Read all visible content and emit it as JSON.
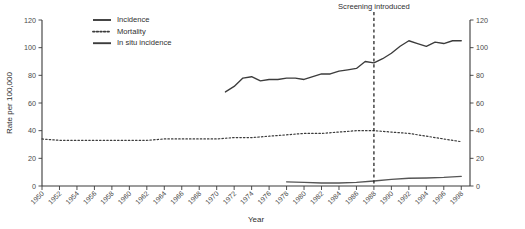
{
  "chart_data": {
    "type": "line",
    "title": "",
    "xlabel": "Year",
    "ylabel": "Rate per 100,000",
    "ylabel_right": "",
    "xlim": [
      1950,
      1999
    ],
    "ylim": [
      0,
      120
    ],
    "grid": false,
    "legend_position": "top-left",
    "y_ticks": [
      0,
      20,
      40,
      60,
      80,
      100,
      120
    ],
    "y_ticks_right": [
      0,
      20,
      40,
      60,
      80,
      100,
      120
    ],
    "x_ticks": [
      1950,
      1952,
      1954,
      1956,
      1958,
      1960,
      1962,
      1964,
      1966,
      1968,
      1970,
      1972,
      1974,
      1976,
      1978,
      1980,
      1982,
      1984,
      1986,
      1988,
      1990,
      1992,
      1994,
      1996,
      1998
    ],
    "annotations": [
      {
        "name": "screening-introduced",
        "label": "Screening introduced",
        "x": 1988,
        "style": "dashed-vertical-line"
      }
    ],
    "series": [
      {
        "name": "Incidence",
        "style": "solid",
        "x": [
          1971,
          1972,
          1973,
          1974,
          1975,
          1976,
          1977,
          1978,
          1979,
          1980,
          1981,
          1982,
          1983,
          1984,
          1985,
          1986,
          1987,
          1988,
          1989,
          1990,
          1991,
          1992,
          1993,
          1994,
          1995,
          1996,
          1997,
          1998
        ],
        "values": [
          68,
          72,
          78,
          79,
          76,
          77,
          77,
          78,
          78,
          77,
          79,
          81,
          81,
          83,
          84,
          85,
          90,
          89,
          92,
          96,
          101,
          105,
          103,
          101,
          104,
          103,
          105,
          105
        ]
      },
      {
        "name": "Mortality",
        "style": "dotted",
        "x": [
          1950,
          1952,
          1954,
          1956,
          1958,
          1960,
          1962,
          1964,
          1966,
          1968,
          1970,
          1972,
          1974,
          1976,
          1978,
          1980,
          1982,
          1984,
          1986,
          1988,
          1990,
          1992,
          1994,
          1996,
          1998
        ],
        "values": [
          34,
          33,
          33,
          33,
          33,
          33,
          33,
          34,
          34,
          34,
          34,
          35,
          35,
          36,
          37,
          38,
          38,
          39,
          40,
          40,
          39,
          38,
          36,
          34,
          32
        ]
      },
      {
        "name": "In situ incidence",
        "style": "solid",
        "x": [
          1978,
          1980,
          1982,
          1984,
          1986,
          1988,
          1990,
          1992,
          1994,
          1996,
          1998
        ],
        "values": [
          3.0,
          2.6,
          2.2,
          2.2,
          2.6,
          3.6,
          4.8,
          5.6,
          5.8,
          6.2,
          7.0
        ]
      }
    ]
  },
  "legend": {
    "items": [
      {
        "label": "Incidence",
        "style": "solid"
      },
      {
        "label": "Mortality",
        "style": "dotted"
      },
      {
        "label": "In situ incidence",
        "style": "solid"
      }
    ]
  }
}
